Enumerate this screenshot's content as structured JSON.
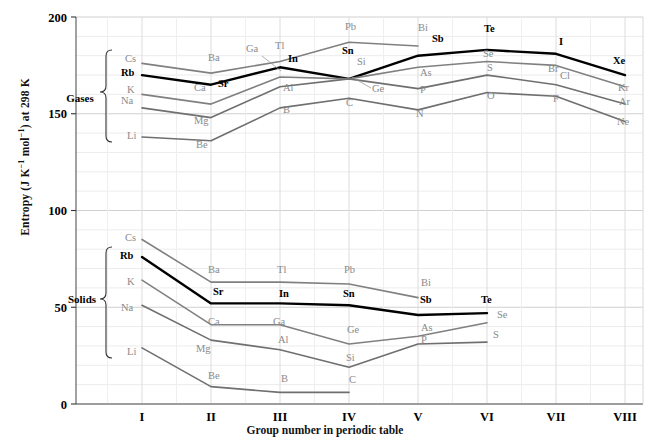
{
  "chart_data": {
    "type": "line",
    "title": "",
    "xlabel": "Group number in periodic table",
    "ylabel": "Entropy (J K−1 mol−1) at 298 K",
    "ylim": [
      0,
      200
    ],
    "yticks": [
      0,
      50,
      100,
      150,
      200
    ],
    "categories": [
      "I",
      "II",
      "III",
      "IV",
      "V",
      "VI",
      "VII",
      "VIII"
    ],
    "grid": true,
    "legend": "none",
    "group_labels": [
      "Gases",
      "Solids"
    ],
    "series": [
      {
        "name": "Gases period 6",
        "state": "gases",
        "color": "#808080",
        "bold": false,
        "points": [
          {
            "label": "Cs",
            "group": "I",
            "value": 176
          },
          {
            "label": "Ba",
            "group": "II",
            "value": 171
          },
          {
            "label": "Tl",
            "group": "III",
            "value": 177
          },
          {
            "label": "Pb",
            "group": "IV",
            "value": 187
          },
          {
            "label": "Bi",
            "group": "V",
            "value": 185
          }
        ]
      },
      {
        "name": "Gases period 5",
        "state": "gases",
        "color": "#000000",
        "bold": true,
        "points": [
          {
            "label": "Rb",
            "group": "I",
            "value": 170
          },
          {
            "label": "Sr",
            "group": "II",
            "value": 165
          },
          {
            "label": "In",
            "group": "III",
            "value": 174
          },
          {
            "label": "Sn",
            "group": "IV",
            "value": 168
          },
          {
            "label": "Sb",
            "group": "V",
            "value": 180
          },
          {
            "label": "Te",
            "group": "VI",
            "value": 183
          },
          {
            "label": "I",
            "group": "VII",
            "value": 181
          },
          {
            "label": "Xe",
            "group": "VIII",
            "value": 170
          }
        ]
      },
      {
        "name": "Gases period 4",
        "state": "gases",
        "color": "#808080",
        "bold": false,
        "points": [
          {
            "label": "K",
            "group": "I",
            "value": 160
          },
          {
            "label": "Ca",
            "group": "II",
            "value": 155
          },
          {
            "label": "Ga",
            "group": "III",
            "value": 169
          },
          {
            "label": "Ge",
            "group": "IV",
            "value": 168
          },
          {
            "label": "As",
            "group": "V",
            "value": 174
          },
          {
            "label": "Se",
            "group": "VI",
            "value": 177
          },
          {
            "label": "Br",
            "group": "VII",
            "value": 175
          },
          {
            "label": "Kr",
            "group": "VIII",
            "value": 164
          }
        ]
      },
      {
        "name": "Gases period 3",
        "state": "gases",
        "color": "#6f6f6f",
        "bold": false,
        "points": [
          {
            "label": "Na",
            "group": "I",
            "value": 153
          },
          {
            "label": "Mg",
            "group": "II",
            "value": 148
          },
          {
            "label": "Al",
            "group": "III",
            "value": 164
          },
          {
            "label": "Si",
            "group": "IV",
            "value": 168
          },
          {
            "label": "P",
            "group": "V",
            "value": 163
          },
          {
            "label": "S",
            "group": "VI",
            "value": 170
          },
          {
            "label": "Cl",
            "group": "VII",
            "value": 165
          },
          {
            "label": "Ar",
            "group": "VIII",
            "value": 155
          }
        ]
      },
      {
        "name": "Gases period 2",
        "state": "gases",
        "color": "#6f6f6f",
        "bold": false,
        "points": [
          {
            "label": "Li",
            "group": "I",
            "value": 138
          },
          {
            "label": "Be",
            "group": "II",
            "value": 136
          },
          {
            "label": "B",
            "group": "III",
            "value": 153
          },
          {
            "label": "C",
            "group": "IV",
            "value": 158
          },
          {
            "label": "N",
            "group": "V",
            "value": 152
          },
          {
            "label": "O",
            "group": "VI",
            "value": 161
          },
          {
            "label": "F",
            "group": "VII",
            "value": 159
          },
          {
            "label": "Ne",
            "group": "VIII",
            "value": 146
          }
        ]
      },
      {
        "name": "Solids period 6",
        "state": "solids",
        "color": "#808080",
        "bold": false,
        "points": [
          {
            "label": "Cs",
            "group": "I",
            "value": 85
          },
          {
            "label": "Ba",
            "group": "II",
            "value": 63
          },
          {
            "label": "Tl",
            "group": "III",
            "value": 63
          },
          {
            "label": "Pb",
            "group": "IV",
            "value": 62
          },
          {
            "label": "Bi",
            "group": "V",
            "value": 55
          }
        ]
      },
      {
        "name": "Solids period 5",
        "state": "solids",
        "color": "#000000",
        "bold": true,
        "points": [
          {
            "label": "Rb",
            "group": "I",
            "value": 76
          },
          {
            "label": "Sr",
            "group": "II",
            "value": 52
          },
          {
            "label": "In",
            "group": "III",
            "value": 52
          },
          {
            "label": "Sn",
            "group": "IV",
            "value": 51
          },
          {
            "label": "Sb",
            "group": "V",
            "value": 46
          },
          {
            "label": "Te",
            "group": "VI",
            "value": 47
          }
        ]
      },
      {
        "name": "Solids period 4",
        "state": "solids",
        "color": "#808080",
        "bold": false,
        "points": [
          {
            "label": "K",
            "group": "I",
            "value": 64
          },
          {
            "label": "Ca",
            "group": "II",
            "value": 41
          },
          {
            "label": "Ga",
            "group": "III",
            "value": 41
          },
          {
            "label": "Ge",
            "group": "IV",
            "value": 31
          },
          {
            "label": "As",
            "group": "V",
            "value": 35
          },
          {
            "label": "Se",
            "group": "VI",
            "value": 42
          }
        ]
      },
      {
        "name": "Solids period 3",
        "state": "solids",
        "color": "#6f6f6f",
        "bold": false,
        "points": [
          {
            "label": "Na",
            "group": "I",
            "value": 51
          },
          {
            "label": "Mg",
            "group": "II",
            "value": 33
          },
          {
            "label": "Al",
            "group": "III",
            "value": 28
          },
          {
            "label": "Si",
            "group": "IV",
            "value": 19
          },
          {
            "label": "P",
            "group": "V",
            "value": 31
          },
          {
            "label": "S",
            "group": "VI",
            "value": 32
          }
        ]
      },
      {
        "name": "Solids period 2",
        "state": "solids",
        "color": "#6f6f6f",
        "bold": false,
        "points": [
          {
            "label": "Li",
            "group": "I",
            "value": 29
          },
          {
            "label": "Be",
            "group": "II",
            "value": 9
          },
          {
            "label": "B",
            "group": "III",
            "value": 6
          },
          {
            "label": "C",
            "group": "IV",
            "value": 6
          }
        ]
      }
    ],
    "point_labels_gases": [
      {
        "text": "Cs",
        "x": 125,
        "y": 62,
        "bold": false
      },
      {
        "text": "Rb",
        "x": 121,
        "y": 76,
        "bold": true
      },
      {
        "text": "K",
        "x": 127,
        "y": 93,
        "bold": false
      },
      {
        "text": "Na",
        "x": 121,
        "y": 104,
        "bold": false
      },
      {
        "text": "Li",
        "x": 127,
        "y": 139,
        "bold": false
      },
      {
        "text": "Ba",
        "x": 208,
        "y": 61,
        "bold": false
      },
      {
        "text": "Sr",
        "x": 218,
        "y": 87,
        "bold": true
      },
      {
        "text": "Ca",
        "x": 194,
        "y": 91,
        "bold": false
      },
      {
        "text": "Mg",
        "x": 194,
        "y": 124,
        "bold": false
      },
      {
        "text": "Be",
        "x": 196,
        "y": 148,
        "bold": false
      },
      {
        "text": "Tl",
        "x": 275,
        "y": 49,
        "bold": false
      },
      {
        "text": "In",
        "x": 288,
        "y": 62,
        "bold": true
      },
      {
        "text": "Ga",
        "x": 246,
        "y": 52,
        "bold": false
      },
      {
        "text": "Al",
        "x": 283,
        "y": 91,
        "bold": false
      },
      {
        "text": "B",
        "x": 283,
        "y": 113,
        "bold": false
      },
      {
        "text": "Pb",
        "x": 345,
        "y": 30,
        "bold": false
      },
      {
        "text": "Sn",
        "x": 342,
        "y": 54,
        "bold": true
      },
      {
        "text": "Si",
        "x": 357,
        "y": 65,
        "bold": false
      },
      {
        "text": "Ge",
        "x": 372,
        "y": 92,
        "bold": false
      },
      {
        "text": "C",
        "x": 346,
        "y": 106,
        "bold": false
      },
      {
        "text": "Bi",
        "x": 418,
        "y": 31,
        "bold": false
      },
      {
        "text": "Sb",
        "x": 432,
        "y": 42,
        "bold": true
      },
      {
        "text": "As",
        "x": 420,
        "y": 76,
        "bold": false
      },
      {
        "text": "P",
        "x": 420,
        "y": 93,
        "bold": false
      },
      {
        "text": "N",
        "x": 416,
        "y": 117,
        "bold": false
      },
      {
        "text": "Te",
        "x": 484,
        "y": 32,
        "bold": true
      },
      {
        "text": "Se",
        "x": 483,
        "y": 57,
        "bold": false
      },
      {
        "text": "S",
        "x": 487,
        "y": 71,
        "bold": false
      },
      {
        "text": "O",
        "x": 487,
        "y": 99,
        "bold": false
      },
      {
        "text": "I",
        "x": 559,
        "y": 45,
        "bold": true
      },
      {
        "text": "Br",
        "x": 548,
        "y": 72,
        "bold": false
      },
      {
        "text": "Cl",
        "x": 560,
        "y": 79,
        "bold": false
      },
      {
        "text": "F",
        "x": 553,
        "y": 102,
        "bold": false
      },
      {
        "text": "Xe",
        "x": 613,
        "y": 64,
        "bold": true
      },
      {
        "text": "Kr",
        "x": 618,
        "y": 91,
        "bold": false
      },
      {
        "text": "Ar",
        "x": 619,
        "y": 105,
        "bold": false
      },
      {
        "text": "Ne",
        "x": 617,
        "y": 125,
        "bold": false
      }
    ],
    "point_labels_solids": [
      {
        "text": "Cs",
        "x": 125,
        "y": 241,
        "bold": false
      },
      {
        "text": "Rb",
        "x": 120,
        "y": 259,
        "bold": true
      },
      {
        "text": "K",
        "x": 127,
        "y": 285,
        "bold": false
      },
      {
        "text": "Na",
        "x": 121,
        "y": 311,
        "bold": false
      },
      {
        "text": "Li",
        "x": 127,
        "y": 355,
        "bold": false
      },
      {
        "text": "Ba",
        "x": 208,
        "y": 273,
        "bold": false
      },
      {
        "text": "Sr",
        "x": 213,
        "y": 295,
        "bold": true
      },
      {
        "text": "Ca",
        "x": 208,
        "y": 325,
        "bold": false
      },
      {
        "text": "Mg",
        "x": 196,
        "y": 352,
        "bold": false
      },
      {
        "text": "Be",
        "x": 208,
        "y": 379,
        "bold": false
      },
      {
        "text": "Tl",
        "x": 277,
        "y": 273,
        "bold": false
      },
      {
        "text": "In",
        "x": 279,
        "y": 297,
        "bold": true
      },
      {
        "text": "Ga",
        "x": 273,
        "y": 325,
        "bold": false
      },
      {
        "text": "Al",
        "x": 278,
        "y": 343,
        "bold": false
      },
      {
        "text": "B",
        "x": 281,
        "y": 382,
        "bold": false
      },
      {
        "text": "Pb",
        "x": 344,
        "y": 273,
        "bold": false
      },
      {
        "text": "Sn",
        "x": 343,
        "y": 297,
        "bold": true
      },
      {
        "text": "Ge",
        "x": 347,
        "y": 333,
        "bold": false
      },
      {
        "text": "Si",
        "x": 346,
        "y": 361,
        "bold": false
      },
      {
        "text": "C",
        "x": 349,
        "y": 383,
        "bold": false
      },
      {
        "text": "Bi",
        "x": 421,
        "y": 286,
        "bold": false
      },
      {
        "text": "Sb",
        "x": 420,
        "y": 303,
        "bold": true
      },
      {
        "text": "As",
        "x": 421,
        "y": 331,
        "bold": false
      },
      {
        "text": "P",
        "x": 421,
        "y": 343,
        "bold": false
      },
      {
        "text": "Te",
        "x": 481,
        "y": 303,
        "bold": true
      },
      {
        "text": "Se",
        "x": 497,
        "y": 318,
        "bold": false
      },
      {
        "text": "S",
        "x": 493,
        "y": 338,
        "bold": false
      }
    ]
  }
}
